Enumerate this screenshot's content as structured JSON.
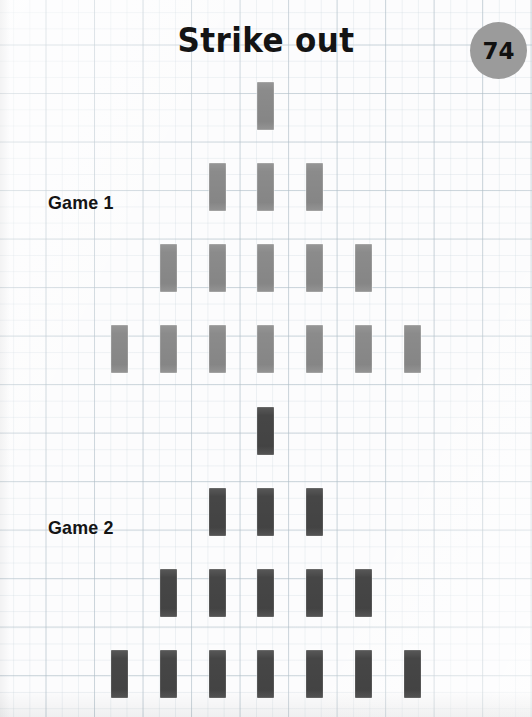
{
  "document": {
    "title": "Strike out",
    "page_number": "74",
    "paper": "graph-paper",
    "grid_color": "#b0bec8",
    "background_color": "#fcfcfd"
  },
  "games": [
    {
      "label": "Game 1",
      "label_x": 48,
      "label_y": 192,
      "pin_color": "#8b8b8b",
      "pin_style": "light",
      "total_pins": 16,
      "rows": [
        {
          "count": 1,
          "y": 82,
          "xs": [
            257
          ]
        },
        {
          "count": 3,
          "y": 163,
          "xs": [
            209,
            257,
            306
          ]
        },
        {
          "count": 5,
          "y": 244,
          "xs": [
            160,
            209,
            257,
            306,
            355
          ]
        },
        {
          "count": 7,
          "y": 325,
          "xs": [
            111,
            160,
            209,
            257,
            306,
            355,
            404
          ]
        }
      ]
    },
    {
      "label": "Game 2",
      "label_x": 48,
      "label_y": 517,
      "pin_color": "#464646",
      "pin_style": "dark",
      "total_pins": 16,
      "rows": [
        {
          "count": 1,
          "y": 407,
          "xs": [
            257
          ]
        },
        {
          "count": 3,
          "y": 488,
          "xs": [
            209,
            257,
            306
          ]
        },
        {
          "count": 5,
          "y": 569,
          "xs": [
            160,
            209,
            257,
            306,
            355
          ]
        },
        {
          "count": 7,
          "y": 650,
          "xs": [
            111,
            160,
            209,
            257,
            306,
            355,
            404
          ]
        }
      ]
    }
  ]
}
